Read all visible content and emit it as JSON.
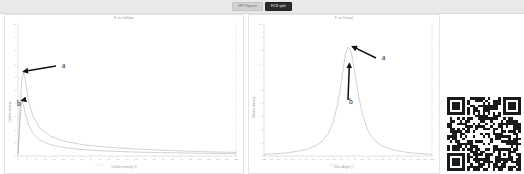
{
  "header": {
    "buttons": [
      {
        "label": "MFI Square",
        "state": "inactive"
      },
      {
        "label": "FCS split",
        "state": "active"
      }
    ],
    "background": "#e9e9e9",
    "active_color": "#2b2b2b"
  },
  "annotations": {
    "letter_a": "a",
    "letter_b": "b"
  },
  "captions": {
    "left": "Fig. 1a",
    "right": "Fig. 1b"
  },
  "qr": {
    "name": "qr-code",
    "foreground": "#1a1a1a",
    "background": "#ffffff",
    "modules": 29
  },
  "chart_data": [
    {
      "type": "line",
      "title": "X vs Cellular",
      "xlabel": "Cellular intensity %",
      "ylabel": "Cellular intensity",
      "xlim": [
        0,
        120
      ],
      "ylim": [
        0,
        10
      ],
      "grid": false,
      "legend": "none",
      "xticks": [
        0,
        5,
        10,
        15,
        20,
        25,
        30,
        35,
        40,
        45,
        50,
        55,
        60,
        65,
        70,
        75,
        80,
        85,
        90,
        95,
        100,
        105,
        110,
        115,
        120
      ],
      "yticks": [
        0,
        1,
        2,
        3,
        4,
        5,
        6,
        7,
        8,
        9,
        10
      ],
      "annotations": [
        {
          "label": "a",
          "target_x": 3.0,
          "target_y": 6.4
        },
        {
          "label": "b",
          "target_x": 2.0,
          "target_y": 4.2
        }
      ],
      "series": [
        {
          "name": "curve-a",
          "x": [
            0,
            1,
            2,
            3,
            4,
            6,
            8,
            12,
            18,
            26,
            36,
            48,
            62,
            78,
            95,
            110,
            120
          ],
          "y": [
            0.2,
            3.2,
            5.6,
            6.4,
            5.7,
            4.1,
            3.1,
            2.1,
            1.5,
            1.1,
            0.85,
            0.68,
            0.55,
            0.45,
            0.36,
            0.3,
            0.28
          ]
        },
        {
          "name": "curve-b",
          "x": [
            0,
            1,
            2,
            3,
            4,
            6,
            8,
            12,
            18,
            26,
            36,
            48,
            62,
            78,
            95,
            110,
            120
          ],
          "y": [
            0.15,
            2.4,
            4.2,
            3.9,
            3.2,
            2.3,
            1.75,
            1.2,
            0.85,
            0.62,
            0.48,
            0.38,
            0.31,
            0.26,
            0.22,
            0.19,
            0.18
          ]
        }
      ]
    },
    {
      "type": "line",
      "title": "X vs Critical",
      "xlabel": "Dose Angle (°)",
      "ylabel": "Relative Intensity",
      "xlim": [
        -120,
        120
      ],
      "ylim": [
        0,
        10
      ],
      "grid": false,
      "legend": "none",
      "xticks": [
        -120,
        -110,
        -100,
        -90,
        -80,
        -70,
        -60,
        -50,
        -40,
        -30,
        -20,
        -10,
        0,
        10,
        20,
        30,
        40,
        50,
        60,
        70,
        80,
        90,
        100,
        110,
        120
      ],
      "yticks": [
        0,
        1,
        2,
        3,
        4,
        5,
        6,
        7,
        8,
        9,
        10
      ],
      "annotations": [
        {
          "label": "a",
          "target_x": 6.0,
          "target_y": 8.3
        },
        {
          "label": "b",
          "target_x": 2.0,
          "target_y": 7.0
        }
      ],
      "series": [
        {
          "name": "peak-curve",
          "x": [
            -120,
            -100,
            -85,
            -70,
            -58,
            -46,
            -36,
            -28,
            -21,
            -15,
            -10,
            -6,
            -3,
            0,
            3,
            6,
            10,
            15,
            21,
            28,
            36,
            46,
            58,
            70,
            85,
            100,
            120
          ],
          "y": [
            0.12,
            0.18,
            0.26,
            0.38,
            0.52,
            0.78,
            1.15,
            1.7,
            2.6,
            3.9,
            5.4,
            6.9,
            7.9,
            8.25,
            8.1,
            7.5,
            6.2,
            4.6,
            3.1,
            2.0,
            1.3,
            0.85,
            0.58,
            0.4,
            0.27,
            0.19,
            0.12
          ]
        }
      ]
    }
  ]
}
